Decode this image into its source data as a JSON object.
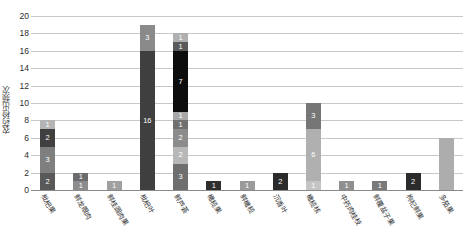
{
  "chart_data": {
    "type": "bar",
    "subtype": "stacked-bar",
    "title": "",
    "xlabel": "",
    "ylabel": "农药检出频次",
    "ylim": [
      0,
      20
    ],
    "ytick_step": 2,
    "yticks": [
      "0",
      "2",
      "4",
      "6",
      "8",
      "10",
      "12",
      "14",
      "16",
      "18",
      "20"
    ],
    "grid": true,
    "legend": false,
    "categories": [
      "枇杷果",
      "鲜龙眼肉",
      "鲜桂圆肉果",
      "枇杷叶",
      "鲜芦荟",
      "橄榄果",
      "鲜橄榄",
      "沉香叶",
      "橄榄核",
      "中药肉桂枝",
      "鲜覆盆子果",
      "枸杞鲜果",
      "多茄果"
    ],
    "totals": [
      8,
      2,
      1,
      19,
      16,
      1,
      1,
      2,
      10,
      1,
      1,
      2,
      6
    ],
    "bars": [
      {
        "category": "枇杷果",
        "total": 8,
        "segments": [
          {
            "value": 2,
            "color": "#595959",
            "label": "2"
          },
          {
            "value": 3,
            "color": "#7f7f7f",
            "label": "3"
          },
          {
            "value": 2,
            "color": "#404040",
            "label": "2"
          },
          {
            "value": 1,
            "color": "#b4b4b4",
            "label": "1"
          }
        ]
      },
      {
        "category": "鲜龙眼肉",
        "total": 2,
        "segments": [
          {
            "value": 1,
            "color": "#8c8c8c",
            "label": "1"
          },
          {
            "value": 1,
            "color": "#6b6b6b",
            "label": "1"
          }
        ]
      },
      {
        "category": "鲜桂圆肉果",
        "total": 1,
        "segments": [
          {
            "value": 1,
            "color": "#a0a0a0",
            "label": "1"
          }
        ]
      },
      {
        "category": "枇杷叶",
        "total": 19,
        "segments": [
          {
            "value": 16,
            "color": "#3f3f3f",
            "label": "16"
          },
          {
            "value": 3,
            "color": "#8a8a8a",
            "label": "3"
          }
        ]
      },
      {
        "category": "鲜芦荟",
        "total": 16,
        "segments": [
          {
            "value": 3,
            "color": "#6f6f6f",
            "label": "3"
          },
          {
            "value": 2,
            "color": "#b8b8b8",
            "label": "2"
          },
          {
            "value": 2,
            "color": "#8c8c8c",
            "label": "2"
          },
          {
            "value": 1,
            "color": "#707070",
            "label": "1"
          },
          {
            "value": 1,
            "color": "#a8a8a8",
            "label": "1"
          },
          {
            "value": 7,
            "color": "#0d0d0d",
            "label": "7"
          },
          {
            "value": 1,
            "color": "#5a5a5a",
            "label": "1"
          },
          {
            "value": 1,
            "color": "#b0b0b0",
            "label": "1"
          }
        ]
      },
      {
        "category": "橄榄果",
        "total": 1,
        "segments": [
          {
            "value": 1,
            "color": "#2e2e2e",
            "label": "1"
          }
        ]
      },
      {
        "category": "鲜橄榄",
        "total": 1,
        "segments": [
          {
            "value": 1,
            "color": "#9a9a9a",
            "label": "1"
          }
        ]
      },
      {
        "category": "沉香叶",
        "total": 2,
        "segments": [
          {
            "value": 2,
            "color": "#2b2b2b",
            "label": "2"
          }
        ]
      },
      {
        "category": "橄榄核",
        "total": 10,
        "segments": [
          {
            "value": 1,
            "color": "#c4c4c4",
            "label": "1"
          },
          {
            "value": 6,
            "color": "#b0b0b0",
            "label": "6"
          },
          {
            "value": 3,
            "color": "#767676",
            "label": "3"
          }
        ]
      },
      {
        "category": "中药肉桂枝",
        "total": 1,
        "segments": [
          {
            "value": 1,
            "color": "#8f8f8f",
            "label": "1"
          }
        ]
      },
      {
        "category": "鲜覆盆子果",
        "total": 1,
        "segments": [
          {
            "value": 1,
            "color": "#7a7a7a",
            "label": "1"
          }
        ]
      },
      {
        "category": "枸杞鲜果",
        "total": 2,
        "segments": [
          {
            "value": 2,
            "color": "#2b2b2b",
            "label": "2"
          }
        ]
      },
      {
        "category": "多茄果",
        "total": 6,
        "segments": [
          {
            "value": 6,
            "color": "#adadad",
            "label": ""
          }
        ]
      }
    ],
    "colors": {
      "gridline": "#c8c8c8",
      "axis": "#8a8a8a",
      "tick_text": "#2b2b2b",
      "segment_label": "#ffffff"
    }
  }
}
